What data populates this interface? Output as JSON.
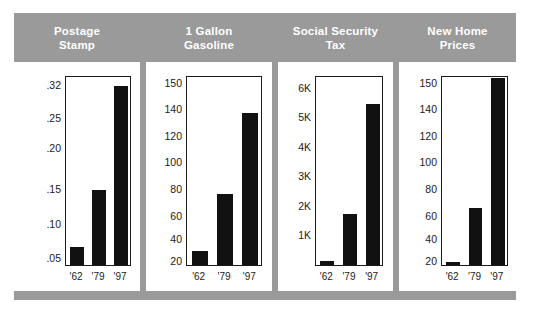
{
  "figure": {
    "background_color": "#ffffff",
    "frame_color": "#9a9a9a",
    "bar_color": "#111111",
    "axis_color": "#1b1b1b",
    "title_color": "#ffffff"
  },
  "panels": [
    {
      "title_line1": "Postage",
      "title_line2": "Stamp",
      "yticks": [
        ".32",
        ".25",
        ".20",
        ".15",
        ".10",
        ".05"
      ],
      "ytick_positions": [
        0.955,
        0.78,
        0.62,
        0.405,
        0.22,
        0.04
      ],
      "xticks": [
        "'62",
        "'79",
        "'97"
      ],
      "bars": [
        0.095,
        0.4,
        0.955
      ]
    },
    {
      "title_line1": "1 Gallon",
      "title_line2": "Gasoline",
      "yticks": [
        "150",
        "140",
        "120",
        "100",
        "80",
        "60",
        "40",
        "20"
      ],
      "ytick_positions": [
        0.965,
        0.825,
        0.685,
        0.545,
        0.405,
        0.265,
        0.14,
        0.025
      ],
      "xticks": [
        "'62",
        "'79",
        "'97"
      ],
      "bars": [
        0.075,
        0.38,
        0.815
      ]
    },
    {
      "title_line1": "Social Security",
      "title_line2": "Tax",
      "yticks": [
        "6K",
        "5K",
        "4K",
        "3K",
        "2K",
        "1K"
      ],
      "ytick_positions": [
        0.935,
        0.782,
        0.626,
        0.472,
        0.318,
        0.163
      ],
      "xticks": [
        "'62",
        "'79",
        "'97"
      ],
      "bars": [
        0.024,
        0.275,
        0.86
      ]
    },
    {
      "title_line1": "New Home",
      "title_line2": "Prices",
      "yticks": [
        "150",
        "140",
        "120",
        "100",
        "80",
        "60",
        "40",
        "20"
      ],
      "ytick_positions": [
        0.965,
        0.825,
        0.685,
        0.545,
        0.405,
        0.265,
        0.14,
        0.025
      ],
      "xticks": [
        "'62",
        "'79",
        "'97"
      ],
      "bars": [
        0.017,
        0.305,
        1.0
      ]
    }
  ],
  "chart_data": [
    {
      "type": "bar",
      "title": "Postage Stamp",
      "categories": [
        "'62",
        "'79",
        "'97"
      ],
      "values": [
        0.04,
        0.15,
        0.32
      ],
      "xlabel": "",
      "ylabel": "",
      "ytick_labels": [
        ".05",
        ".10",
        ".15",
        ".20",
        ".25",
        ".32"
      ],
      "ylim": [
        0,
        0.33
      ],
      "grid": false,
      "legend": "none"
    },
    {
      "type": "bar",
      "title": "1 Gallon Gasoline",
      "categories": [
        "'62",
        "'79",
        "'97"
      ],
      "values": [
        28,
        76,
        139
      ],
      "xlabel": "",
      "ylabel": "",
      "ytick_labels": [
        "20",
        "40",
        "60",
        "80",
        "100",
        "120",
        "140",
        "150"
      ],
      "ylim": [
        0,
        155
      ],
      "grid": false,
      "legend": "none"
    },
    {
      "type": "bar",
      "title": "Social Security Tax",
      "categories": [
        "'62",
        "'79",
        "'97"
      ],
      "values": [
        150,
        1700,
        5600
      ],
      "xlabel": "",
      "ylabel": "",
      "ytick_labels": [
        "1K",
        "2K",
        "3K",
        "4K",
        "5K",
        "6K"
      ],
      "ylim": [
        0,
        6400
      ],
      "grid": false,
      "legend": "none"
    },
    {
      "type": "bar",
      "title": "New Home Prices",
      "categories": [
        "'62",
        "'79",
        "'97"
      ],
      "values": [
        17,
        68,
        153
      ],
      "xlabel": "",
      "ylabel": "",
      "ytick_labels": [
        "20",
        "40",
        "60",
        "80",
        "100",
        "120",
        "140",
        "150"
      ],
      "ylim": [
        0,
        155
      ],
      "grid": false,
      "legend": "none"
    }
  ]
}
